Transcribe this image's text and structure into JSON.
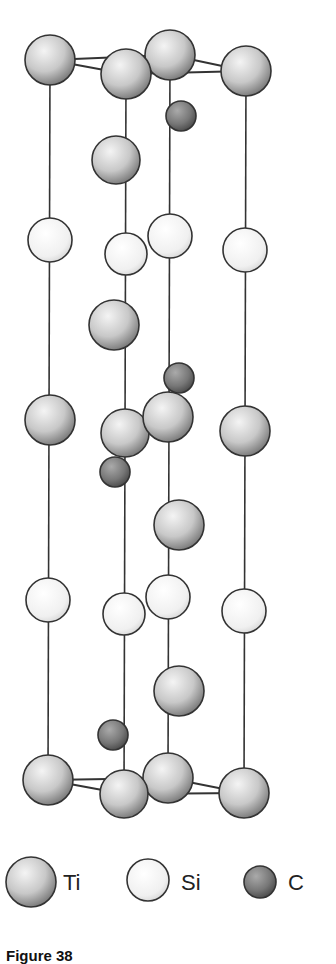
{
  "diagram": {
    "type": "crystal-structure-unit-cell",
    "bonds": [
      [
        50,
        60,
        126,
        74
      ],
      [
        50,
        60,
        170,
        55
      ],
      [
        126,
        74,
        246,
        71
      ],
      [
        170,
        55,
        246,
        71
      ],
      [
        48,
        780,
        124,
        794
      ],
      [
        48,
        780,
        168,
        778
      ],
      [
        124,
        794,
        244,
        793
      ],
      [
        168,
        778,
        244,
        793
      ]
    ],
    "axes": [
      {
        "x1": 50,
        "y1": 60,
        "x2": 48,
        "y2": 780
      },
      {
        "x1": 126,
        "y1": 74,
        "x2": 124,
        "y2": 794
      },
      {
        "x1": 170,
        "y1": 55,
        "x2": 168,
        "y2": 778
      },
      {
        "x1": 246,
        "y1": 71,
        "x2": 244,
        "y2": 793
      }
    ],
    "atoms": [
      {
        "el": "Ti",
        "x": 50,
        "y": 60,
        "r": 25
      },
      {
        "el": "Ti",
        "x": 170,
        "y": 55,
        "r": 25
      },
      {
        "el": "Ti",
        "x": 246,
        "y": 71,
        "r": 25
      },
      {
        "el": "Ti",
        "x": 126,
        "y": 74,
        "r": 25
      },
      {
        "el": "C",
        "x": 181,
        "y": 116,
        "r": 15
      },
      {
        "el": "Ti",
        "x": 116,
        "y": 160,
        "r": 24
      },
      {
        "el": "Si",
        "x": 50,
        "y": 240,
        "r": 22
      },
      {
        "el": "Si",
        "x": 170,
        "y": 236,
        "r": 22
      },
      {
        "el": "Si",
        "x": 245,
        "y": 250,
        "r": 22
      },
      {
        "el": "Si",
        "x": 126,
        "y": 254,
        "r": 21
      },
      {
        "el": "Ti",
        "x": 114,
        "y": 325,
        "r": 25
      },
      {
        "el": "C",
        "x": 179,
        "y": 378,
        "r": 15
      },
      {
        "el": "Ti",
        "x": 50,
        "y": 420,
        "r": 25
      },
      {
        "el": "Ti",
        "x": 245,
        "y": 431,
        "r": 25
      },
      {
        "el": "Ti",
        "x": 125,
        "y": 433,
        "r": 24
      },
      {
        "el": "Ti",
        "x": 168,
        "y": 417,
        "r": 25
      },
      {
        "el": "C",
        "x": 115,
        "y": 472,
        "r": 15
      },
      {
        "el": "Ti",
        "x": 179,
        "y": 525,
        "r": 25
      },
      {
        "el": "Si",
        "x": 48,
        "y": 600,
        "r": 22
      },
      {
        "el": "Si",
        "x": 168,
        "y": 597,
        "r": 22
      },
      {
        "el": "Si",
        "x": 244,
        "y": 611,
        "r": 22
      },
      {
        "el": "Si",
        "x": 124,
        "y": 614,
        "r": 21
      },
      {
        "el": "Ti",
        "x": 179,
        "y": 691,
        "r": 25
      },
      {
        "el": "C",
        "x": 113,
        "y": 735,
        "r": 15
      },
      {
        "el": "Ti",
        "x": 48,
        "y": 780,
        "r": 25
      },
      {
        "el": "Ti",
        "x": 244,
        "y": 793,
        "r": 25
      },
      {
        "el": "Ti",
        "x": 168,
        "y": 778,
        "r": 25
      },
      {
        "el": "Ti",
        "x": 124,
        "y": 794,
        "r": 24
      }
    ]
  },
  "legend": {
    "items": [
      {
        "label": "Ti",
        "element": "Ti",
        "x": 31,
        "y": 882,
        "r": 25,
        "label_x": 63,
        "label_y": 878
      },
      {
        "label": "Si",
        "element": "Si",
        "x": 148,
        "y": 880,
        "r": 21,
        "label_x": 181,
        "label_y": 878
      },
      {
        "label": "C",
        "element": "C",
        "x": 260,
        "y": 882,
        "r": 16,
        "label_x": 288,
        "label_y": 878
      }
    ]
  },
  "caption": "Figure 38"
}
